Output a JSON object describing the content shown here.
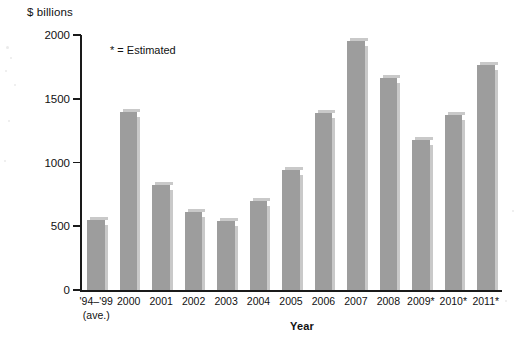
{
  "chart_data": {
    "type": "bar",
    "title": "",
    "ylabel": "$ billions",
    "xlabel": "Year",
    "annotation": "* = Estimated",
    "ylim": [
      0,
      2000
    ],
    "yticks": [
      0,
      500,
      1000,
      1500,
      2000
    ],
    "ytick_labels": [
      "0",
      "500",
      "1000",
      "1500",
      "2000"
    ],
    "grid": false,
    "legend": "none",
    "bar_color": "#9d9d9d",
    "categories": [
      "'94–'99",
      "2000",
      "2001",
      "2002",
      "2003",
      "2004",
      "2005",
      "2006",
      "2007",
      "2008",
      "2009*",
      "2010*",
      "2011*"
    ],
    "category_sublabels": [
      "(ave.)",
      "",
      "",
      "",
      "",
      "",
      "",
      "",
      "",
      "",
      "",
      "",
      ""
    ],
    "values": [
      550,
      1400,
      825,
      610,
      545,
      700,
      940,
      1390,
      1950,
      1665,
      1175,
      1370,
      1765
    ]
  }
}
